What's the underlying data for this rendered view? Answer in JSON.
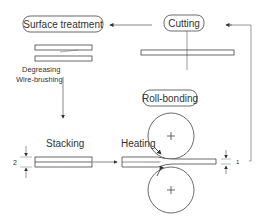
{
  "diagram": {
    "steps": {
      "surface_treatment": "Surface treatment",
      "cutting": "Cutting",
      "roll_bonding": "Roll-bonding",
      "stacking": "Stacking",
      "heating": "Heating"
    },
    "sub_steps": {
      "degreasing": "Degreasing",
      "wire_brushing": "Wire-brushing"
    },
    "dimensions": {
      "stack_thickness": "2",
      "rolled_thickness": "1"
    },
    "colors": {
      "line": "#333333",
      "text": "#333333",
      "background": "#ffffff"
    }
  }
}
